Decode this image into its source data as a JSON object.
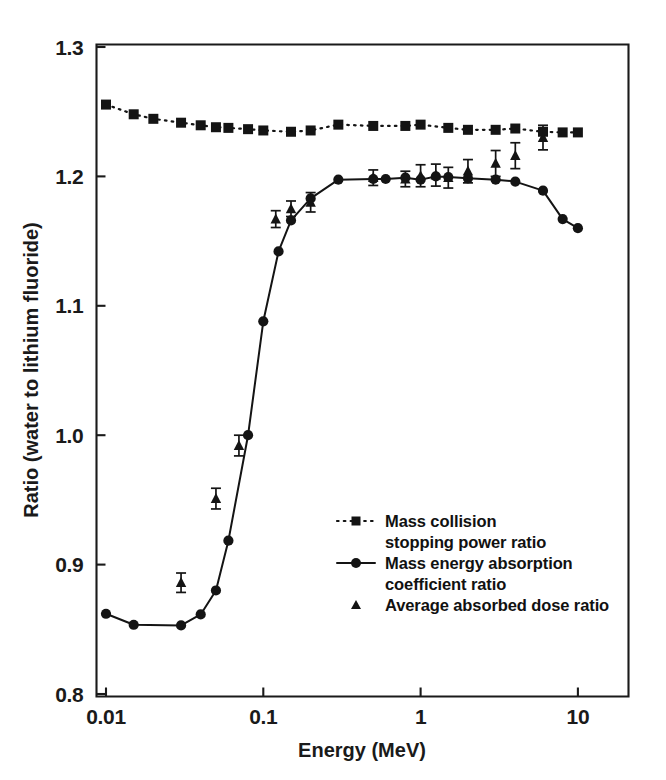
{
  "figure": {
    "background": "#ffffff",
    "ink_color": "#141414"
  },
  "chart_data": {
    "type": "line",
    "title": "",
    "subtitle": "",
    "xlabel": "Energy (MeV)",
    "ylabel": "Ratio (water to lithium fluoride)",
    "xscale": "log",
    "yscale": "linear",
    "xlim": [
      0.0085,
      20
    ],
    "ylim": [
      0.8,
      1.3
    ],
    "grid": false,
    "legend_position": "center-right-inside",
    "x_ticks": [
      0.01,
      0.1,
      1,
      10
    ],
    "x_tick_labels": [
      "0.01",
      "0.1",
      "1",
      "10"
    ],
    "y_ticks": [
      0.8,
      0.9,
      1.0,
      1.1,
      1.2,
      1.3
    ],
    "y_tick_labels": [
      "0.8",
      "0.9",
      "1.0",
      "1.1",
      "1.2",
      "1.3"
    ],
    "series": [
      {
        "name": "Mass collision stopping power ratio",
        "marker": "square",
        "linestyle": "dotted",
        "x": [
          0.01,
          0.015,
          0.02,
          0.03,
          0.04,
          0.05,
          0.06,
          0.08,
          0.1,
          0.15,
          0.2,
          0.3,
          0.5,
          0.8,
          1.0,
          1.5,
          2.0,
          3.0,
          4.0,
          6.0,
          8.0,
          10.0
        ],
        "y": [
          1.2555,
          1.248,
          1.2445,
          1.2415,
          1.2395,
          1.238,
          1.2375,
          1.2365,
          1.2355,
          1.2345,
          1.2355,
          1.24,
          1.239,
          1.239,
          1.24,
          1.2375,
          1.236,
          1.236,
          1.237,
          1.2345,
          1.234,
          1.234
        ]
      },
      {
        "name": "Mass energy absorption coefficient ratio",
        "marker": "circle",
        "linestyle": "solid",
        "x": [
          0.01,
          0.015,
          0.03,
          0.04,
          0.05,
          0.06,
          0.08,
          0.1,
          0.125,
          0.15,
          0.2,
          0.3,
          0.5,
          0.6,
          0.8,
          1.0,
          1.25,
          1.5,
          2.0,
          3.0,
          4.0,
          6.0,
          8.0,
          10.0
        ],
        "y": [
          0.862,
          0.8535,
          0.853,
          0.8615,
          0.88,
          0.9185,
          1.0,
          1.088,
          1.142,
          1.166,
          1.183,
          1.1975,
          1.198,
          1.198,
          1.199,
          1.1975,
          1.2,
          1.1995,
          1.1985,
          1.1975,
          1.196,
          1.189,
          1.167,
          1.16
        ]
      },
      {
        "name": "Average absorbed dose ratio",
        "marker": "triangle",
        "linestyle": "none",
        "x": [
          0.03,
          0.05,
          0.07,
          0.12,
          0.15,
          0.2,
          0.5,
          0.8,
          1.0,
          1.25,
          1.5,
          2.0,
          3.0,
          4.0,
          6.0
        ],
        "y": [
          0.886,
          0.951,
          0.992,
          1.167,
          1.175,
          1.18,
          1.199,
          1.198,
          1.2005,
          1.201,
          1.199,
          1.204,
          1.21,
          1.216,
          1.23
        ],
        "yerr": [
          0.0075,
          0.008,
          0.008,
          0.0065,
          0.006,
          0.0075,
          0.006,
          0.006,
          0.0085,
          0.0085,
          0.008,
          0.009,
          0.01,
          0.01,
          0.0095
        ]
      }
    ]
  },
  "legend": {
    "entries": [
      {
        "marker": "square-dotted",
        "lines": [
          "Mass collision",
          "stopping power ratio"
        ]
      },
      {
        "marker": "circle-solid",
        "lines": [
          "Mass energy absorption",
          "coefficient ratio"
        ]
      },
      {
        "marker": "triangle",
        "lines": [
          "Average absorbed dose ratio"
        ]
      }
    ]
  }
}
